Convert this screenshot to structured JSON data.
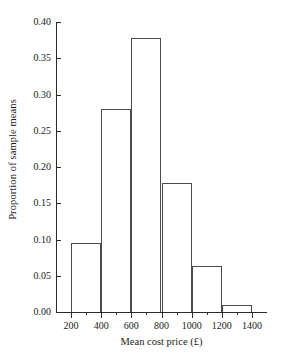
{
  "chart_data": {
    "type": "bar",
    "title": "",
    "subtitle": "",
    "xlabel": "Mean cost price (£)",
    "ylabel": "Proportion of sample means",
    "grid": false,
    "legend": null,
    "xlim": [
      100,
      1500
    ],
    "ylim": [
      0.0,
      0.4
    ],
    "bin_width": 200,
    "categories": [
      "200-400",
      "400-600",
      "600-800",
      "800-1000",
      "1000-1200",
      "1200-1400"
    ],
    "bin_edges": [
      200,
      400,
      600,
      800,
      1000,
      1200,
      1400
    ],
    "values": [
      0.095,
      0.28,
      0.378,
      0.178,
      0.063,
      0.01
    ],
    "bars": [
      {
        "label": "200-400",
        "start": 200,
        "end": 400,
        "value": 0.095
      },
      {
        "label": "400-600",
        "start": 400,
        "end": 600,
        "value": 0.28
      },
      {
        "label": "600-800",
        "start": 600,
        "end": 800,
        "value": 0.378
      },
      {
        "label": "800-1000",
        "start": 800,
        "end": 1000,
        "value": 0.178
      },
      {
        "label": "1000-1200",
        "start": 1000,
        "end": 1200,
        "value": 0.063
      },
      {
        "label": "1200-1400",
        "start": 1200,
        "end": 1400,
        "value": 0.01
      }
    ],
    "y_ticks": [
      0.0,
      0.05,
      0.1,
      0.15,
      0.2,
      0.25,
      0.3,
      0.35,
      0.4
    ],
    "y_tick_labels": [
      "0.00",
      "0.05",
      "0.10",
      "0.15",
      "0.20",
      "0.25",
      "0.30",
      "0.35",
      "0.40"
    ],
    "x_ticks": [
      200,
      400,
      600,
      800,
      1000,
      1200,
      1400
    ],
    "x_tick_labels": [
      "200",
      "400",
      "600",
      "800",
      "1000",
      "1200",
      "1400"
    ],
    "x_minor_ticks": [
      300,
      500,
      700,
      900,
      1100,
      1300
    ],
    "colors": {
      "bar_edge": "#4a4a4a",
      "bar_fill": "none",
      "axis": "#2b2b2b",
      "text": "#1a1a1a",
      "background": "#ffffff"
    }
  }
}
